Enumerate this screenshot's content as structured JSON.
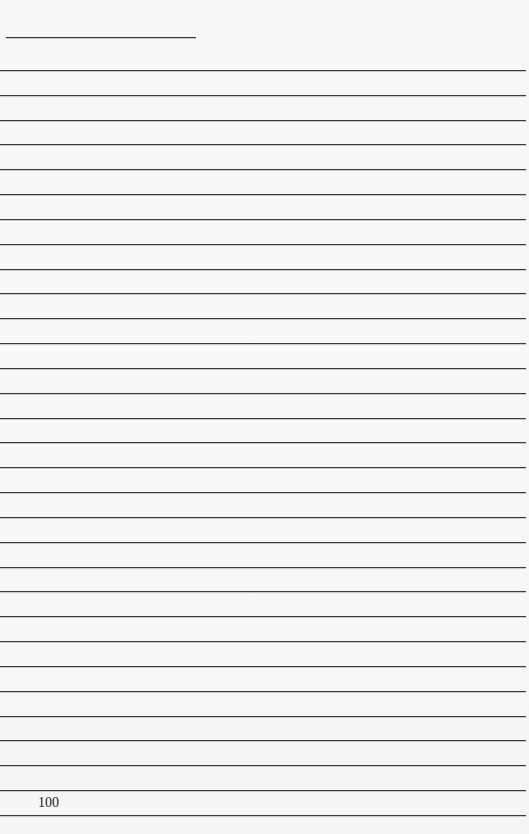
{
  "page": {
    "type": "lined-notebook-page",
    "page_number": "100",
    "ruled_line_count": 31,
    "first_line_y": 70,
    "line_spacing": 24.83,
    "line_color": "#3a3a3a",
    "background_color": "#f7f7f6",
    "header_rule": {
      "present": true
    }
  }
}
